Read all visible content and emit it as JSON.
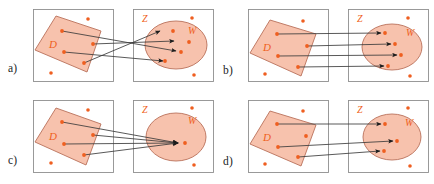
{
  "figure": {
    "title": "",
    "panels": [
      {
        "id": "a",
        "caption": "a)",
        "domain_label": "D",
        "latent_label": "Z",
        "subset_label": "W",
        "mapping_type": "crossing",
        "arrow_count": 4,
        "description": "Arrows from D cross each other before reaching distinct points in W"
      },
      {
        "id": "b",
        "caption": "b)",
        "domain_label": "D",
        "latent_label": "Z",
        "subset_label": "W",
        "mapping_type": "parallel",
        "arrow_count": 4,
        "description": "Four parallel non-crossing arrows map D onto distinct points in W"
      },
      {
        "id": "c",
        "caption": "c)",
        "domain_label": "D",
        "latent_label": "Z",
        "subset_label": "W",
        "mapping_type": "collapse",
        "arrow_count": 4,
        "description": "All four arrows converge onto a single point inside W"
      },
      {
        "id": "d",
        "caption": "d)",
        "domain_label": "D",
        "latent_label": "Z",
        "subset_label": "W",
        "mapping_type": "partial",
        "arrow_count": 3,
        "description": "Only three of the four points of D are mapped into W"
      }
    ],
    "colors": {
      "region_fill": "#f6bda6",
      "region_stroke": "#b9705a",
      "point": "#ef5f20",
      "arrow": "#3b3b3b",
      "frame": "#8f8f8f",
      "caption_text": "#201d1c",
      "label_text": "#ef5f20",
      "background": "#ffffff"
    }
  }
}
